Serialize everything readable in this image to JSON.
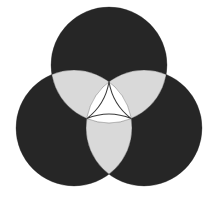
{
  "figure": {
    "background_color": "#ffffff",
    "width": 218,
    "height": 209
  },
  "chart_data": {
    "type": "venn",
    "subtitle": "",
    "xlabel": "",
    "ylabel": "",
    "set_count": 3,
    "layout": "symmetric-triangular",
    "grid": false,
    "legend": "none",
    "colors": {
      "single_region": "#262626",
      "pair_region": "#d9d9d9",
      "triple_region": "#ffffff",
      "outline": "#3a3a3a",
      "background": "#ffffff"
    },
    "circles": [
      {
        "id": "set-top",
        "label": "",
        "cx": 109,
        "cy": 65,
        "r": 58,
        "fill": "#262626"
      },
      {
        "id": "set-bottom-left",
        "label": "",
        "cx": 74,
        "cy": 128,
        "r": 58,
        "fill": "#262626"
      },
      {
        "id": "set-bottom-right",
        "label": "",
        "cx": 144,
        "cy": 128,
        "r": 58,
        "fill": "#262626"
      }
    ],
    "regions": [
      {
        "id": "only-top",
        "sets": [
          "set-top"
        ],
        "shade": "dark",
        "fill": "#262626"
      },
      {
        "id": "only-bottom-left",
        "sets": [
          "set-bottom-left"
        ],
        "shade": "dark",
        "fill": "#262626"
      },
      {
        "id": "only-bottom-right",
        "sets": [
          "set-bottom-right"
        ],
        "shade": "dark",
        "fill": "#262626"
      },
      {
        "id": "top-and-bottom-left",
        "sets": [
          "set-top",
          "set-bottom-left"
        ],
        "shade": "light",
        "fill": "#d9d9d9"
      },
      {
        "id": "top-and-bottom-right",
        "sets": [
          "set-top",
          "set-bottom-right"
        ],
        "shade": "light",
        "fill": "#d9d9d9"
      },
      {
        "id": "bottom-left-and-bottom-right",
        "sets": [
          "set-bottom-left",
          "set-bottom-right"
        ],
        "shade": "light",
        "fill": "#d9d9d9"
      },
      {
        "id": "all-three",
        "sets": [
          "set-top",
          "set-bottom-left",
          "set-bottom-right"
        ],
        "shade": "white",
        "fill": "#ffffff"
      }
    ],
    "annotations": []
  }
}
